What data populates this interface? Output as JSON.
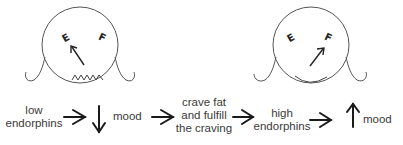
{
  "diagram": {
    "faces": [
      {
        "id": "sad-face",
        "gauge_left": "E",
        "gauge_right": "F",
        "needle_points_to": "E",
        "mouth": "zigzag"
      },
      {
        "id": "happy-face",
        "gauge_left": "E",
        "gauge_right": "F",
        "needle_points_to": "F",
        "mouth": "smile"
      }
    ],
    "flow": {
      "step1": {
        "line1": "low",
        "line2": "endorphins"
      },
      "step2": {
        "arrow": "down",
        "label": "mood"
      },
      "step3": {
        "line1": "crave fat",
        "line2": "and fulfill",
        "line3": "the craving"
      },
      "step4": {
        "line1": "high",
        "line2": "endorphins"
      },
      "step5": {
        "arrow": "up",
        "label": "mood"
      }
    },
    "colors": {
      "stroke": "#555555",
      "text": "#3a3a3a",
      "arrow": "#1a1a1a",
      "background": "#ffffff"
    }
  }
}
